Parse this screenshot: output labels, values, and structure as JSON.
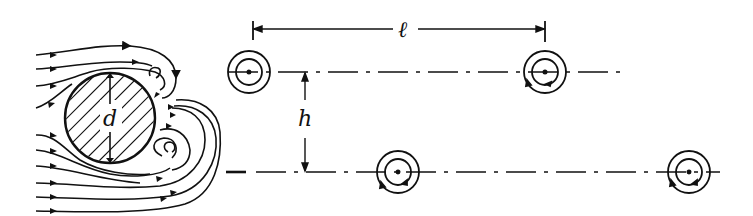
{
  "diagram": {
    "colors": {
      "ink": "#111111",
      "background": "#ffffff"
    },
    "cylinder": {
      "label": "d",
      "cx": 110,
      "cy": 118,
      "r": 45,
      "hatched": true
    },
    "streamlines_upstream_y": [
      55,
      69,
      86,
      108,
      135,
      150,
      166,
      183,
      197,
      211
    ],
    "vortex_rows": {
      "upper_y": 72,
      "lower_y": 172
    },
    "vortices": [
      {
        "name": "upper-1",
        "cx": 249,
        "cy": 72,
        "r_outer": 21,
        "r_inner": 13
      },
      {
        "name": "upper-2",
        "cx": 545,
        "cy": 72,
        "r_outer": 21,
        "r_inner": 13
      },
      {
        "name": "lower-1",
        "cx": 398,
        "cy": 172,
        "r_outer": 21,
        "r_inner": 13
      },
      {
        "name": "lower-2",
        "cx": 689,
        "cy": 172,
        "r_outer": 21,
        "r_inner": 13
      }
    ],
    "dimensions": {
      "spacing": {
        "label": "ℓ",
        "x1": 253,
        "x2": 545,
        "y": 29
      },
      "row_gap": {
        "label": "h",
        "x": 305,
        "y1": 72,
        "y2": 172
      }
    }
  }
}
